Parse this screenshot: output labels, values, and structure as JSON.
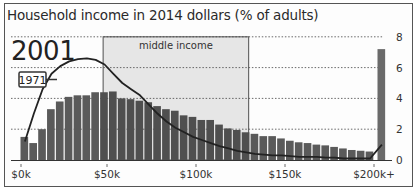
{
  "chart_data": {
    "type": "bar",
    "title": "Household income in 2014 dollars (% of adults)",
    "annotation_year": "2001",
    "line_label": "1971",
    "region_label": "middle income",
    "xlabel": "",
    "ylabel": "",
    "ylim": [
      0,
      8
    ],
    "yticks": [
      "0",
      "2",
      "4",
      "6",
      "8"
    ],
    "xticks": [
      "$0k",
      "$50k",
      "$100k",
      "$150k",
      "$200k+"
    ],
    "grid": true,
    "colors": {
      "bar": "#555555",
      "bar_top": "#8a8a8a",
      "line": "#222222",
      "region": "#e6e6e6"
    },
    "bins_label": "$5k income bins, $0k–$200k, then $200k+",
    "series": [
      {
        "name": "2001",
        "values": [
          1.5,
          1.1,
          2.0,
          3.3,
          3.8,
          4.1,
          4.2,
          4.2,
          4.4,
          4.4,
          4.45,
          4.0,
          3.95,
          3.85,
          3.75,
          3.5,
          3.3,
          3.2,
          2.9,
          2.8,
          2.6,
          2.6,
          2.3,
          2.05,
          1.95,
          1.8,
          1.7,
          1.55,
          1.55,
          1.4,
          1.25,
          1.15,
          1.1,
          1.0,
          0.95,
          0.85,
          0.75,
          0.65,
          0.6,
          0.55,
          7.2
        ]
      },
      {
        "name": "1971",
        "type": "line",
        "values": [
          1.2,
          3.0,
          4.6,
          5.6,
          6.1,
          6.4,
          6.55,
          6.6,
          6.5,
          6.2,
          5.6,
          5.0,
          4.6,
          4.2,
          3.6,
          3.0,
          2.5,
          2.1,
          1.8,
          1.5,
          1.3,
          1.1,
          0.9,
          0.75,
          0.6,
          0.5,
          0.4,
          0.35,
          0.3,
          0.3,
          0.25,
          0.2,
          0.2,
          0.2,
          0.15,
          0.15,
          0.1,
          0.1,
          0.1,
          0.1,
          1.0
        ]
      }
    ],
    "middle_income_range": [
      "$45k",
      "$125k"
    ]
  }
}
